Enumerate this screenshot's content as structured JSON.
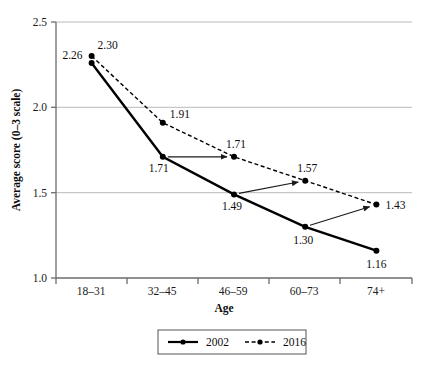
{
  "chart_data": {
    "type": "line",
    "title": "",
    "xlabel": "Age",
    "ylabel": "Average score (0–3 scale)",
    "categories": [
      "18–31",
      "32–45",
      "46–59",
      "60–73",
      "74+"
    ],
    "ylim": [
      1.0,
      2.5
    ],
    "yticks": [
      "1.0",
      "1.5",
      "2.0",
      "2.5"
    ],
    "ytick_values": [
      1.0,
      1.5,
      2.0,
      2.5
    ],
    "grid": "horizontal",
    "legend_position": "bottom",
    "series": [
      {
        "name": "2002",
        "style": "solid",
        "marker": "filled-circle",
        "color": "#000000",
        "values": [
          2.26,
          1.71,
          1.49,
          1.3,
          1.16
        ],
        "labels": [
          "2.26",
          "1.71",
          "1.49",
          "1.30",
          "1.16"
        ]
      },
      {
        "name": "2016",
        "style": "dashed",
        "marker": "filled-circle",
        "color": "#000000",
        "values": [
          2.3,
          1.91,
          1.71,
          1.57,
          1.43
        ],
        "labels": [
          "2.30",
          "1.91",
          "1.71",
          "1.57",
          "1.43"
        ]
      }
    ],
    "annotations": [
      {
        "kind": "arrow",
        "from_series": "2002",
        "from_category": "32–45",
        "from_value": 1.71,
        "to_series": "2016",
        "to_category": "46–59",
        "to_value": 1.71
      },
      {
        "kind": "arrow",
        "from_series": "2002",
        "from_category": "46–59",
        "from_value": 1.49,
        "to_series": "2016",
        "to_category": "60–73",
        "to_value": 1.57
      },
      {
        "kind": "arrow",
        "from_series": "2002",
        "from_category": "60–73",
        "from_value": 1.3,
        "to_series": "2016",
        "to_category": "74+",
        "to_value": 1.43
      }
    ]
  },
  "axes": {
    "y_title": "Average score (0–3 scale)",
    "x_title": "Age",
    "y_ticks": [
      "2.5",
      "2.0",
      "1.5",
      "1.0"
    ],
    "x_ticks": [
      "18–31",
      "32–45",
      "46–59",
      "60–73",
      "74+"
    ]
  },
  "legend": {
    "entries": [
      {
        "label": "2002",
        "style": "solid"
      },
      {
        "label": "2016",
        "style": "dashed"
      }
    ]
  },
  "data_labels": {
    "s2002": [
      "2.26",
      "1.71",
      "1.49",
      "1.30",
      "1.16"
    ],
    "s2016": [
      "2.30",
      "1.91",
      "1.71",
      "1.57",
      "1.43"
    ]
  },
  "colors": {
    "line": "#000000",
    "grid": "#b9b9b9",
    "axis": "#6b6b6b",
    "text": "#0d0d0d",
    "background": "#ffffff"
  }
}
